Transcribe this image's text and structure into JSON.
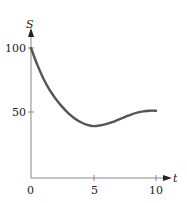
{
  "chart_data": {
    "type": "line",
    "title": "",
    "xlabel": "t",
    "ylabel": "S",
    "xlim": [
      0,
      10
    ],
    "ylim": [
      0,
      100
    ],
    "grid": false,
    "legend": null,
    "x_ticks": [
      0,
      5,
      10
    ],
    "x_tick_labels": [
      "0",
      "5",
      "10"
    ],
    "y_ticks": [
      50,
      100
    ],
    "y_tick_labels": [
      "50",
      "100"
    ],
    "series": [
      {
        "name": "S(t)",
        "color": "#555555",
        "x": [
          0,
          0.5,
          1,
          1.5,
          2,
          2.5,
          3,
          3.5,
          4,
          4.5,
          5,
          5.5,
          6,
          6.5,
          7,
          7.5,
          8,
          8.5,
          9,
          9.5,
          10
        ],
        "y": [
          100,
          87,
          76,
          67,
          60,
          54,
          49,
          45,
          42,
          40,
          39,
          39.5,
          40.5,
          42,
          44,
          46,
          48,
          49.5,
          50.5,
          51,
          51
        ]
      }
    ]
  },
  "labels": {
    "y_axis": "S",
    "x_axis": "t",
    "origin": "0",
    "x5": "5",
    "x10": "10",
    "y50": "50",
    "y100": "100"
  }
}
